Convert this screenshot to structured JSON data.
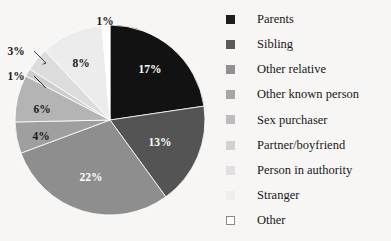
{
  "background_color": "#f7f6f4",
  "chart_data": {
    "type": "pie",
    "title": "",
    "subtitle": "",
    "xlabel": "",
    "ylabel": "",
    "legend_position": "right",
    "grid": false,
    "units": "percent",
    "start_angle_deg": 0,
    "direction": "clockwise",
    "categories": [
      "Parents",
      "Sibling",
      "Other relative",
      "Other known person",
      "Sex purchaser",
      "Partner/boyfriend",
      "Person in authority",
      "Stranger",
      "Other"
    ],
    "values": [
      17,
      13,
      22,
      4,
      6,
      1,
      3,
      8,
      1
    ],
    "slice_labels": [
      "17%",
      "13%",
      "22%",
      "4%",
      "6%",
      "1%",
      "3%",
      "8%",
      "1%"
    ],
    "colors": [
      "#121212",
      "#545454",
      "#8e8e8e",
      "#9f9f9f",
      "#b4b4b4",
      "#cdcdcd",
      "#dcdcdc",
      "#ececec",
      "#ffffff"
    ],
    "label_text_colors": [
      "#ffffff",
      "#ffffff",
      "#ffffff",
      "#1a1a1a",
      "#1a1a1a",
      "#1a1a1a",
      "#1a1a1a",
      "#1a1a1a",
      "#1a1a1a"
    ],
    "callout_slices": [
      "Partner/boyfriend",
      "Person in authority"
    ]
  },
  "pie": {
    "center_x": 110,
    "center_y": 120,
    "radius": 95,
    "slices": [
      {
        "name": "Parents",
        "value": 17,
        "label": "17%",
        "color": "#121212",
        "text_color": "#ffffff",
        "label_x": 150,
        "label_y": 70,
        "callout": false
      },
      {
        "name": "Sibling",
        "value": 13,
        "label": "13%",
        "color": "#545454",
        "text_color": "#ffffff",
        "label_x": 160,
        "label_y": 143,
        "callout": false
      },
      {
        "name": "Other relative",
        "value": 22,
        "label": "22%",
        "color": "#8e8e8e",
        "text_color": "#ffffff",
        "label_x": 91,
        "label_y": 178,
        "callout": false
      },
      {
        "name": "Other known person",
        "value": 4,
        "label": "4%",
        "color": "#9f9f9f",
        "text_color": "#1a1a1a",
        "label_x": 41,
        "label_y": 137,
        "callout": false
      },
      {
        "name": "Sex purchaser",
        "value": 6,
        "label": "6%",
        "color": "#b4b4b4",
        "text_color": "#1a1a1a",
        "label_x": 42,
        "label_y": 110,
        "callout": false
      },
      {
        "name": "Partner/boyfriend",
        "value": 1,
        "label": "1%",
        "color": "#cdcdcd",
        "text_color": "#1a1a1a",
        "label_x": 16,
        "label_y": 77,
        "callout": true
      },
      {
        "name": "Person in authority",
        "value": 3,
        "label": "3%",
        "color": "#dcdcdc",
        "text_color": "#1a1a1a",
        "label_x": 16,
        "label_y": 52,
        "callout": true
      },
      {
        "name": "Stranger",
        "value": 8,
        "label": "8%",
        "color": "#ececec",
        "text_color": "#1a1a1a",
        "label_x": 81,
        "label_y": 64,
        "callout": false
      },
      {
        "name": "Other",
        "value": 1,
        "label": "1%",
        "color": "#ffffff",
        "text_color": "#1a1a1a",
        "label_x": 105,
        "label_y": 22,
        "callout": false
      }
    ]
  },
  "legend": {
    "items": [
      {
        "label": "Parents",
        "color": "#1c1c1c",
        "border": "#1c1c1c"
      },
      {
        "label": "Sibling",
        "color": "#5a5a5a",
        "border": "#5a5a5a"
      },
      {
        "label": "Other relative",
        "color": "#919191",
        "border": "#919191"
      },
      {
        "label": "Other known person",
        "color": "#a6a6a6",
        "border": "#a6a6a6"
      },
      {
        "label": "Sex purchaser",
        "color": "#bcbcbc",
        "border": "#bcbcbc"
      },
      {
        "label": "Partner/boyfriend",
        "color": "#d2d2d2",
        "border": "#d2d2d2"
      },
      {
        "label": "Person in authority",
        "color": "#e0e0e0",
        "border": "#e0e0e0"
      },
      {
        "label": "Stranger",
        "color": "#eeeeee",
        "border": "#eeeeee"
      },
      {
        "label": "Other",
        "color": "#ffffff",
        "border": "#8a8a8a"
      }
    ]
  }
}
